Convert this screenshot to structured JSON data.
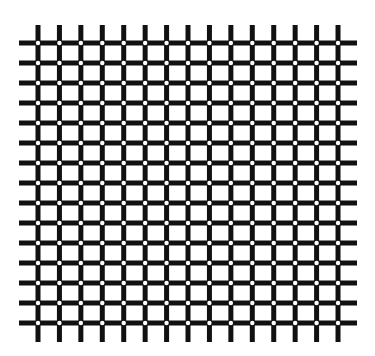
{
  "figure": {
    "background": "#ffffff",
    "line_color": "#111111",
    "dot_color": "#ffffff",
    "columns": 15,
    "rows": 15,
    "col_start_x": 38,
    "col_spacing": 21.43,
    "row_start_y": 43,
    "row_spacing": 20,
    "line_width": 5,
    "dot_radius": 2.2,
    "h_line_extent": [
      19,
      357
    ],
    "v_line_extent": [
      25,
      342
    ]
  }
}
